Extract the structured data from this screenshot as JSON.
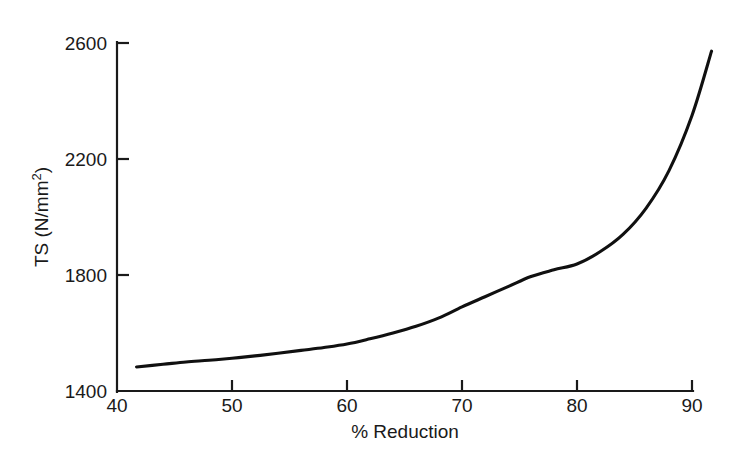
{
  "figure": {
    "background_color": "#ffffff",
    "curve_color": "#101010",
    "axis_color": "#1a1a1a"
  },
  "axes": {
    "x_title": "% Reduction",
    "y_title_main": "TS (N/mm",
    "y_title_sup": "2",
    "y_title_close": ")",
    "x_ticks": [
      "40",
      "50",
      "60",
      "70",
      "80",
      "90"
    ],
    "y_ticks": [
      "2600",
      "2200",
      "1800",
      "1400"
    ]
  },
  "chart_data": {
    "type": "line",
    "title": "",
    "xlabel": "% Reduction",
    "ylabel": "TS (N/mm2)",
    "xlim": [
      40,
      92
    ],
    "ylim": [
      1400,
      2600
    ],
    "xticks": [
      40,
      50,
      60,
      70,
      80,
      90
    ],
    "yticks": [
      1400,
      1800,
      2200,
      2600
    ],
    "grid": false,
    "legend": "none",
    "series": [
      {
        "name": "Tensile strength vs cold work reduction",
        "x": [
          41.7,
          44,
          46,
          48,
          50,
          52,
          54,
          56,
          58,
          60,
          62,
          64,
          66,
          68,
          70,
          72,
          74,
          76,
          78,
          80,
          82,
          84,
          86,
          88,
          90,
          91.7
        ],
        "values": [
          1483,
          1492,
          1500,
          1506,
          1513,
          1521,
          1530,
          1540,
          1550,
          1562,
          1580,
          1600,
          1623,
          1652,
          1690,
          1725,
          1760,
          1795,
          1818,
          1838,
          1880,
          1940,
          2030,
          2160,
          2350,
          2572
        ]
      }
    ]
  }
}
